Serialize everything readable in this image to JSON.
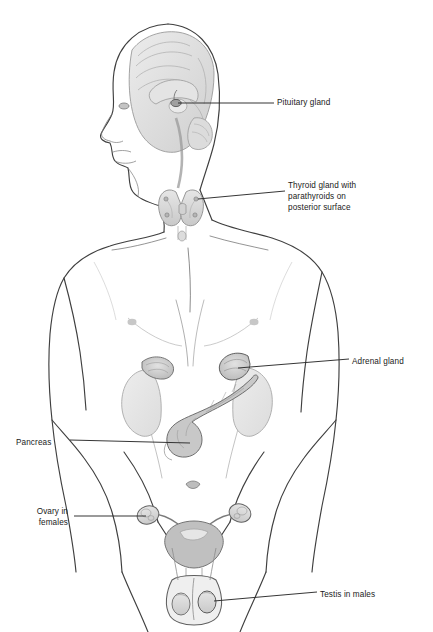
{
  "figure": {
    "background_color": "#ffffff",
    "line_color": "#3a3a3a",
    "organ_fill": "#d9d9d9",
    "text_color": "#1a1a1a"
  },
  "labels": [
    {
      "id": "pituitary",
      "text": "Pituitary gland",
      "x": 277,
      "y": 97,
      "align": "left"
    },
    {
      "id": "thyroid",
      "text": "Thyroid gland with",
      "x": 288,
      "y": 180,
      "align": "left"
    },
    {
      "id": "thyroid2",
      "text": "parathyroids on",
      "x": 288,
      "y": 191,
      "align": "left"
    },
    {
      "id": "thyroid3",
      "text": "posterior surface",
      "x": 288,
      "y": 202,
      "align": "left"
    },
    {
      "id": "adrenal",
      "text": "Adrenal gland",
      "x": 352,
      "y": 356,
      "align": "left"
    },
    {
      "id": "pancreas",
      "text": "Pancreas",
      "x": 16,
      "y": 437,
      "align": "left"
    },
    {
      "id": "ovary",
      "text": "Ovary in",
      "x": 28,
      "y": 506,
      "align": "left"
    },
    {
      "id": "ovary2",
      "text": "females",
      "x": 28,
      "y": 517,
      "align": "left"
    },
    {
      "id": "testis",
      "text": "Testis in males",
      "x": 320,
      "y": 589,
      "align": "left"
    }
  ],
  "glands": [
    {
      "id": "pituitary-gland",
      "name": "Pituitary gland"
    },
    {
      "id": "thyroid-gland",
      "name": "Thyroid gland with parathyroids on posterior surface"
    },
    {
      "id": "adrenal-gland",
      "name": "Adrenal gland"
    },
    {
      "id": "pancreas-gland",
      "name": "Pancreas"
    },
    {
      "id": "ovary-gland",
      "name": "Ovary in females"
    },
    {
      "id": "testis-gland",
      "name": "Testis in males"
    }
  ]
}
